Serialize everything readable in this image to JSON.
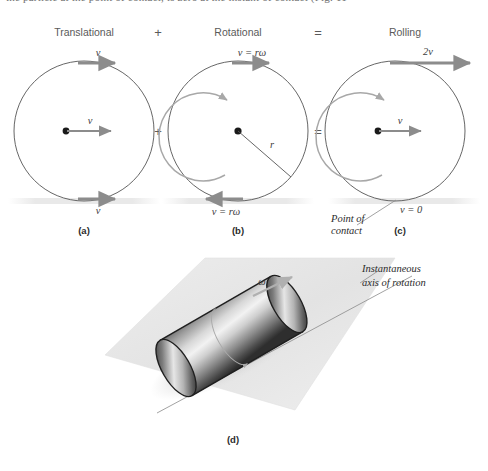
{
  "figure": {
    "clipped_top_line": "the particle at the point of contact, is zero at the instant of contact (Fig. 11-",
    "panels": [
      {
        "id": "a",
        "heading": "Translational",
        "panel_label": "(a)",
        "top_arrow_label": "v",
        "center_arrow_label": "v",
        "bottom_arrow_label": "v",
        "center_dot": true
      },
      {
        "id": "b",
        "heading": "Rotational",
        "panel_label": "(b)",
        "top_arrow_label": "v = rω",
        "bottom_arrow_label": "v = rω",
        "radius_label": "r",
        "center_dot": true
      },
      {
        "id": "c",
        "heading": "Rolling",
        "panel_label": "(c)",
        "top_arrow_label": "2v",
        "center_arrow_label": "v",
        "bottom_label": "v = 0",
        "contact_annotation_line1": "Point of",
        "contact_annotation_line2": "contact",
        "center_dot": true
      }
    ],
    "operators": {
      "plus_top": "+",
      "plus_mid": "+",
      "equals_top": "=",
      "equals_mid": "="
    },
    "lower_panel": {
      "panel_label": "(d)",
      "omega_label": "ω",
      "axis_label_line1": "Instantaneous",
      "axis_label_line2": "axis of rotation"
    },
    "colors": {
      "background": "#ffffff",
      "circle_stroke": "#555555",
      "arrow_gray": "#8c8c8c",
      "curve_arrow_gray": "#a8a8a8",
      "heading_text": "#5a5a5a",
      "math_text": "#3d3d3d",
      "panel_label_text": "#2b2b2b",
      "ground_band": "#ededed",
      "plane_fill": "#e2e2e2",
      "cylinder_dark": "#2e2e2e",
      "cylinder_light": "#f2f2f2"
    }
  }
}
